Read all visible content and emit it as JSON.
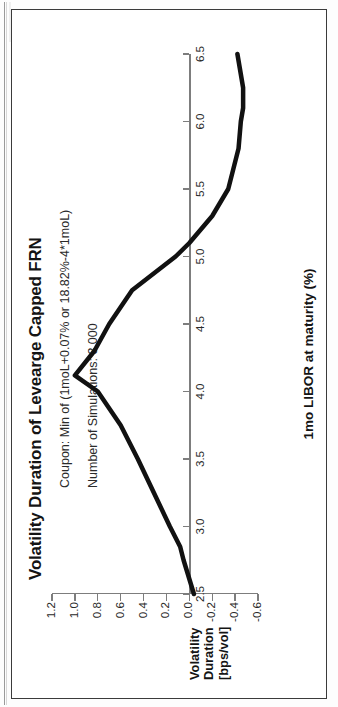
{
  "chart_data": {
    "type": "line",
    "title": "Volatility Duration of Levearge Capped FRN",
    "xlabel": "1mo LIBOR at maturity (%)",
    "ylabel": "Volatility Duration [bps/vol]",
    "ylabel_lines": [
      "Volatility",
      "Duration",
      "[bps/vol]"
    ],
    "annotations": [
      "Coupon: Min of (1moL+0.07% or 18.82%-4*1moL)",
      "Number of Simulations: 3,000"
    ],
    "xlim": [
      2.5,
      6.5
    ],
    "ylim": [
      -0.6,
      1.2
    ],
    "xticks": [
      2.5,
      3.0,
      3.5,
      4.0,
      4.5,
      5.0,
      5.5,
      6.0,
      6.5
    ],
    "xtick_labels": [
      "2.5",
      "3.0",
      "3.5",
      "4.0",
      "4.5",
      "5.0",
      "5.5",
      "6.0",
      "6.5"
    ],
    "yticks": [
      1.2,
      1.0,
      0.8,
      0.6,
      0.4,
      0.2,
      0.0,
      -0.2,
      -0.4,
      -0.6
    ],
    "ytick_labels": [
      "1.2",
      "1.0",
      "0.8",
      "0.6",
      "0.4",
      "0.2",
      "0.0",
      "-0.2",
      "-0.4",
      "-0.6"
    ],
    "grid": false,
    "legend": null,
    "line_color": "#111111",
    "line_width": 4.5,
    "x": [
      2.5,
      2.75,
      2.85,
      3.0,
      3.25,
      3.5,
      3.75,
      4.0,
      4.12,
      4.3,
      4.5,
      4.75,
      5.0,
      5.1,
      5.3,
      5.5,
      5.6,
      5.8,
      6.0,
      6.1,
      6.25,
      6.4,
      6.5
    ],
    "values": [
      -0.04,
      0.05,
      0.08,
      0.17,
      0.31,
      0.45,
      0.6,
      0.8,
      1.0,
      0.83,
      0.7,
      0.5,
      0.12,
      0.0,
      -0.2,
      -0.34,
      -0.37,
      -0.43,
      -0.45,
      -0.47,
      -0.47,
      -0.44,
      -0.42
    ]
  },
  "figure": {
    "frame_color": "#3b3b3b",
    "background": "#ffffff"
  }
}
